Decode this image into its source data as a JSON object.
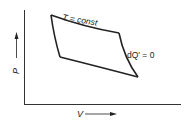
{
  "diagram": {
    "axes": {
      "x_label": "V",
      "y_label": "P"
    },
    "annotations": {
      "isotherm": "T = const",
      "adiabat": "dQ' = 0"
    },
    "colors": {
      "line": "#222222",
      "background": "#ffffff"
    }
  }
}
